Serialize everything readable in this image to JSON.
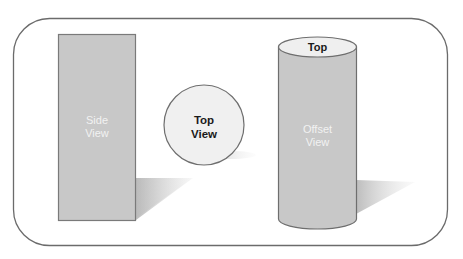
{
  "diagram": {
    "frame": {
      "stroke": "#6b6b6b",
      "fill": "#ffffff"
    },
    "shapes": [
      {
        "id": "side-view",
        "kind": "rectangle",
        "label_line1": "Side",
        "label_line2": "View",
        "fill": "#c8c8c8",
        "stroke": "#7a7a7a",
        "text_color": "#f2f2f2"
      },
      {
        "id": "top-view",
        "kind": "circle",
        "label_line1": "Top",
        "label_line2": "View",
        "fill": "#f0f0f0",
        "stroke": "#6e6e6e",
        "text_color": "#1a1a1a"
      },
      {
        "id": "offset-view",
        "kind": "cylinder",
        "top_label": "Top",
        "label_line1": "Offset",
        "label_line2": "View",
        "fill": "#c8c8c8",
        "top_fill": "#efefef",
        "stroke": "#6e6e6e",
        "text_color": "#f2f2f2",
        "top_text_color": "#1a1a1a"
      }
    ],
    "shadow_color": "#bdbdbd"
  }
}
